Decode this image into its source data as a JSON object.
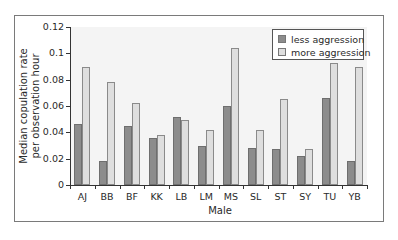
{
  "chart_data": {
    "type": "bar",
    "title": "",
    "xlabel": "Male",
    "ylabel": "Median copulation rate per observation hour",
    "ylabel_lines": [
      "Median copulation rate",
      "per observation hour"
    ],
    "ylim": [
      0,
      0.12
    ],
    "yticks": [
      "0",
      "0.02",
      "0.04",
      "0.06",
      "0.08",
      "0.1",
      "0.12"
    ],
    "grid": false,
    "legend_position": "top-right",
    "categories": [
      "AJ",
      "BB",
      "BF",
      "KK",
      "LB",
      "LM",
      "MS",
      "SL",
      "ST",
      "SY",
      "TU",
      "YB"
    ],
    "series": [
      {
        "name": "less aggression",
        "color": "#8c8c8c",
        "values": [
          0.046,
          0.018,
          0.045,
          0.036,
          0.052,
          0.03,
          0.06,
          0.028,
          0.027,
          0.022,
          0.066,
          0.018
        ]
      },
      {
        "name": "more aggression",
        "color": "#dedede",
        "values": [
          0.09,
          0.078,
          0.062,
          0.038,
          0.049,
          0.042,
          0.104,
          0.042,
          0.065,
          0.027,
          0.093,
          0.09
        ]
      }
    ]
  }
}
